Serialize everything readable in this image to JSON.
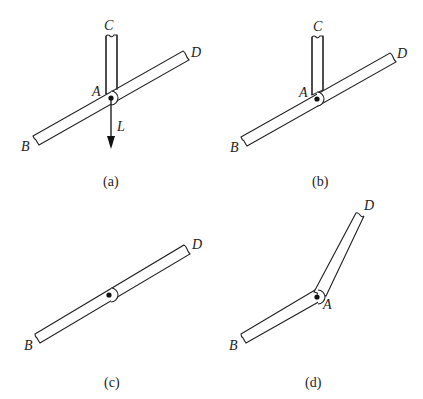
{
  "figure": {
    "panels": [
      {
        "id": "a",
        "caption": "(a)",
        "labels": {
          "C": "C",
          "D": "D",
          "A": "A",
          "B": "B",
          "L": "L"
        },
        "description": "Vertical member C pinned at A to straight bar B–D, with downward load L applied at A"
      },
      {
        "id": "b",
        "caption": "(b)",
        "labels": {
          "C": "C",
          "D": "D",
          "A": "A",
          "B": "B"
        },
        "description": "Vertical member C pinned at A to straight bar B–D, no load"
      },
      {
        "id": "c",
        "caption": "(c)",
        "labels": {
          "D": "D",
          "B": "B"
        },
        "description": "Straight bar B–D with pin joint at middle"
      },
      {
        "id": "d",
        "caption": "(d)",
        "labels": {
          "D": "D",
          "A": "A",
          "B": "B"
        },
        "description": "Two members B–A and A–D joined by a pin at A, forming an angle"
      }
    ]
  }
}
